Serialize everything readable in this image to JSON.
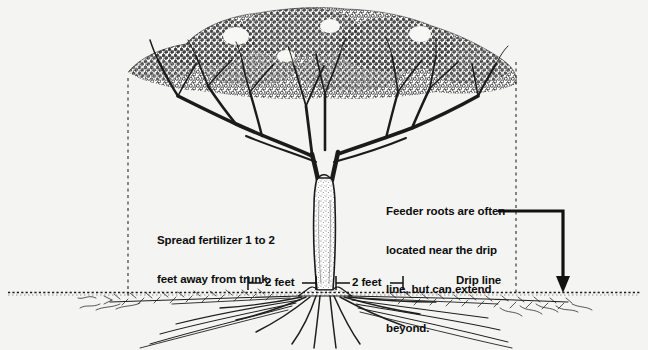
{
  "diagram": {
    "background_color": "#f4f4f2",
    "ink_color": "#111111",
    "labels": {
      "fertilizer_line1": "Spread fertilizer 1 to 2",
      "fertilizer_line2": "feet away from trunk.",
      "feeder_line1": "Feeder roots are often",
      "feeder_line2": "located near the drip",
      "feeder_line3": "line, but can extend",
      "feeder_line4": "beyond.",
      "drip_line": "Drip line",
      "dimension_left": "2 feet",
      "dimension_right": "2 feet"
    },
    "elements": {
      "canopy": "tree-canopy-stippled",
      "trunk": "tree-trunk",
      "roots": "root-system",
      "ground": "ground-line",
      "drip_line_left": "dashed-vertical-left",
      "drip_line_right": "dashed-vertical-right",
      "leader_arrow": "feeder-root-arrow"
    }
  }
}
